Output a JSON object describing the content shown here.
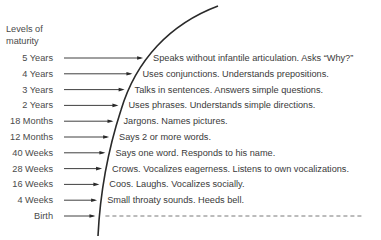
{
  "diagram": {
    "axis_title_line1": "Levels of",
    "axis_title_line2": "maturity",
    "levels": [
      {
        "label": "5 Years",
        "description": "Speaks without infantile articulation.  Asks “Why?”"
      },
      {
        "label": "4 Years",
        "description": "Uses conjunctions.  Understands prepositions."
      },
      {
        "label": "3 Years",
        "description": "Talks in sentences.  Answers simple questions."
      },
      {
        "label": "2 Years",
        "description": "Uses phrases.  Understands simple directions."
      },
      {
        "label": "18 Months",
        "description": "Jargons.  Names pictures."
      },
      {
        "label": "12 Months",
        "description": "Says 2 or more words."
      },
      {
        "label": "40 Weeks",
        "description": "Says one word.  Responds to his name."
      },
      {
        "label": "28 Weeks",
        "description": "Crows.  Vocalizes eagerness.  Listens to own vocalizations."
      },
      {
        "label": "16 Weeks",
        "description": "Coos.  Laughs.  Vocalizes socially."
      },
      {
        "label": "4 Weeks",
        "description": "Small throaty sounds.  Heeds bell."
      },
      {
        "label": "Birth",
        "description": ""
      }
    ],
    "colors": {
      "ink": "#2a2a2a",
      "text": "#3a3a3a"
    }
  }
}
